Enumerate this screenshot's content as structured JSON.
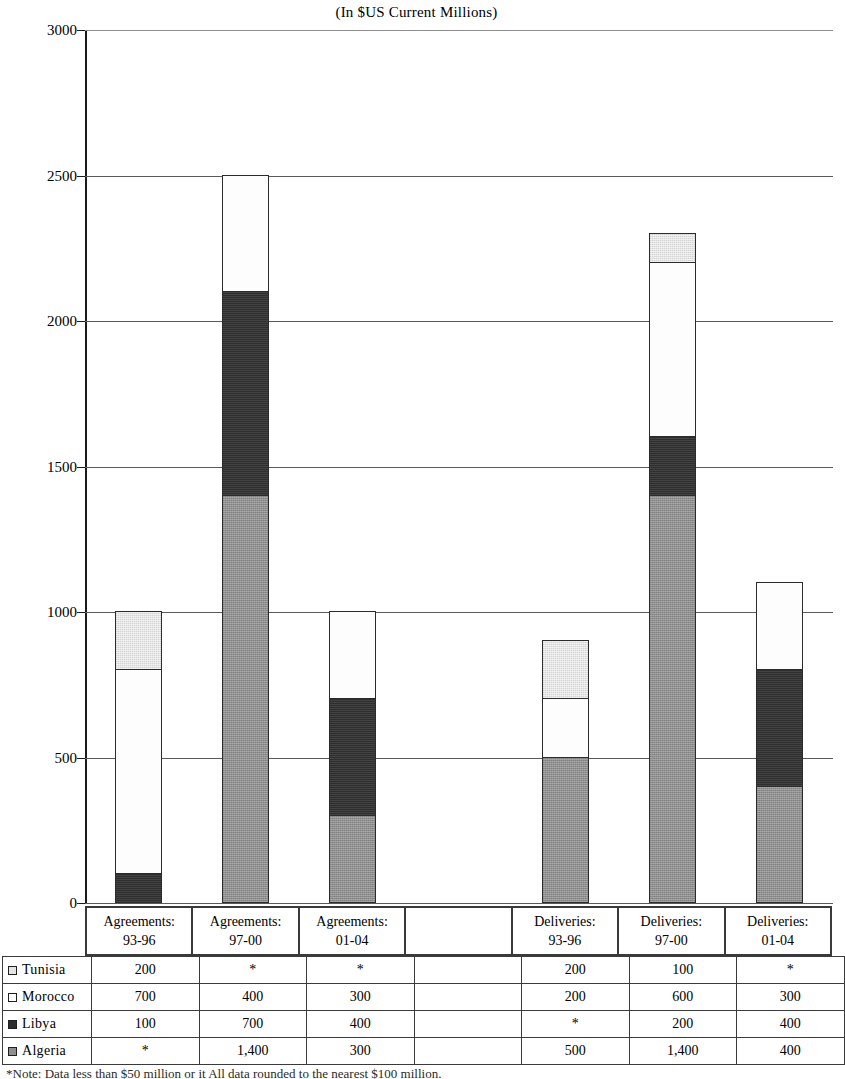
{
  "chart_data": {
    "type": "bar",
    "title": "(In $US Current Millions)",
    "xlabel": "",
    "ylabel": "",
    "ylim": [
      0,
      3000
    ],
    "yticks": [
      0,
      500,
      1000,
      1500,
      2000,
      2500,
      3000
    ],
    "ytick_labels": [
      "0",
      "500",
      "1000",
      "1500",
      "2000",
      "2500",
      "3000"
    ],
    "grid": true,
    "stacked": true,
    "legend_position": "table-row-labels",
    "categories": [
      "Agreements: 93-96",
      "Agreements: 97-00",
      "Agreements: 01-04",
      "",
      "Deliveries: 93-96",
      "Deliveries: 97-00",
      "Deliveries: 01-04"
    ],
    "series": [
      {
        "name": "Algeria",
        "color": "#8f8f8f",
        "values": [
          0,
          1400,
          300,
          null,
          500,
          1400,
          400
        ],
        "labels": [
          "*",
          "1,400",
          "300",
          "",
          "500",
          "1,400",
          "400"
        ]
      },
      {
        "name": "Libya",
        "color": "#2e2e2e",
        "values": [
          100,
          700,
          400,
          null,
          0,
          200,
          400
        ],
        "labels": [
          "100",
          "700",
          "400",
          "",
          "*",
          "200",
          "400"
        ]
      },
      {
        "name": "Morocco",
        "color": "#fdfdfd",
        "values": [
          700,
          400,
          300,
          null,
          200,
          600,
          300
        ],
        "labels": [
          "700",
          "400",
          "300",
          "",
          "200",
          "600",
          "300"
        ]
      },
      {
        "name": "Tunisia",
        "color": "#e4e4e4",
        "values": [
          200,
          0,
          0,
          null,
          200,
          100,
          0
        ],
        "labels": [
          "200",
          "*",
          "*",
          "",
          "200",
          "100",
          "*"
        ]
      }
    ],
    "stack_order_bottom_to_top": [
      "Algeria",
      "Libya",
      "Morocco",
      "Tunisia"
    ],
    "totals": [
      1000,
      2500,
      1000,
      null,
      900,
      2300,
      1100
    ]
  },
  "category_header": [
    {
      "line1": "Agreements:",
      "line2": "93-96"
    },
    {
      "line1": "Agreements:",
      "line2": "97-00"
    },
    {
      "line1": "Agreements:",
      "line2": "01-04"
    },
    {
      "line1": "",
      "line2": ""
    },
    {
      "line1": "Deliveries:",
      "line2": "93-96"
    },
    {
      "line1": "Deliveries:",
      "line2": "97-00"
    },
    {
      "line1": "Deliveries:",
      "line2": "01-04"
    }
  ],
  "table": {
    "rows": [
      {
        "label": "Tunisia",
        "swatch": "tunisia",
        "cells": [
          "200",
          "*",
          "*",
          "",
          "200",
          "100",
          "*"
        ]
      },
      {
        "label": "Morocco",
        "swatch": "morocco",
        "cells": [
          "700",
          "400",
          "300",
          "",
          "200",
          "600",
          "300"
        ]
      },
      {
        "label": "Libya",
        "swatch": "libya",
        "cells": [
          "100",
          "700",
          "400",
          "",
          "*",
          "200",
          "400"
        ]
      },
      {
        "label": "Algeria",
        "swatch": "algeria",
        "cells": [
          "*",
          "1,400",
          "300",
          "",
          "500",
          "1,400",
          "400"
        ]
      }
    ]
  },
  "footnote": "*Note: Data less than $50 million or it All data rounded to the nearest $100 million."
}
